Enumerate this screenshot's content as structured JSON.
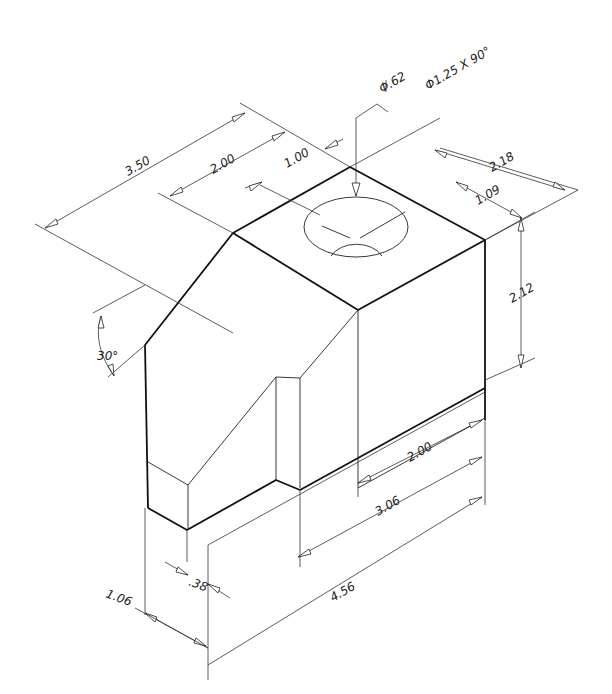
{
  "drawing": {
    "type": "isometric-technical-drawing",
    "units": "inches",
    "background": "#ffffff",
    "line_color": "#111111"
  },
  "hole_callout": {
    "thru_diameter": "Φ.62",
    "countersink": "Φ1.25 X 90°"
  },
  "dimensions": {
    "overall_depth": "3.50",
    "top_step_depth": "2.00",
    "hole_offset_depth": "1.00",
    "overall_width": "2.18",
    "hole_offset_width": "1.09",
    "upper_height": "2.12",
    "chamfer_angle": "30°",
    "lower_step_length": "2.00",
    "slot_length": "3.06",
    "overall_length": "4.56",
    "slot_width": ".38",
    "base_height": "1.06"
  }
}
